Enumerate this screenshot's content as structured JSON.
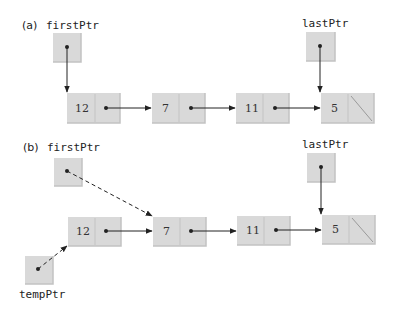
{
  "colors": {
    "box_fill": "#d9d9d9",
    "box_shade": "#c4c4c4",
    "box_highlight": "#e6e6e6",
    "line": "#222222",
    "text": "#222222"
  },
  "part_a": {
    "label": "(a)",
    "first_ptr": {
      "name": "firstPtr",
      "x": 53,
      "y": 33
    },
    "last_ptr": {
      "name": "lastPtr",
      "x": 306,
      "y": 32
    },
    "nodes": [
      {
        "value": "12",
        "x": 67,
        "y": 93,
        "next": "7"
      },
      {
        "value": "7",
        "x": 152,
        "y": 93,
        "next": "11"
      },
      {
        "value": "11",
        "x": 236,
        "y": 93,
        "next": "5"
      },
      {
        "value": "5",
        "x": 321,
        "y": 93,
        "next": null
      }
    ]
  },
  "part_b": {
    "label": "(b)",
    "first_ptr": {
      "name": "firstPtr",
      "x": 54,
      "y": 158
    },
    "last_ptr": {
      "name": "lastPtr",
      "x": 307,
      "y": 153
    },
    "temp_ptr": {
      "name": "tempPtr",
      "x": 25,
      "y": 256
    },
    "nodes": [
      {
        "value": "12",
        "x": 68,
        "y": 217,
        "next": "7"
      },
      {
        "value": "7",
        "x": 153,
        "y": 217,
        "next": "11"
      },
      {
        "value": "11",
        "x": 237,
        "y": 216,
        "next": "5"
      },
      {
        "value": "5",
        "x": 322,
        "y": 215,
        "next": null
      }
    ]
  }
}
